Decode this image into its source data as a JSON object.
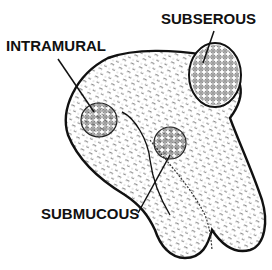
{
  "diagram": {
    "labels": {
      "intramural": "INTRAMURAL",
      "subserous": "SUBSEROUS",
      "submucous": "SUBMUCOUS"
    },
    "colors": {
      "ink": "#111111",
      "background": "#ffffff"
    }
  }
}
